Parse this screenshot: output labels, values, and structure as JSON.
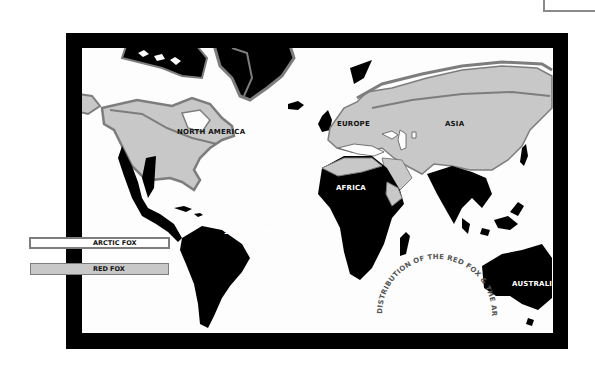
{
  "map": {
    "title": "DISTRIBUTION OF THE RED FOX & THE ARCTIC FOX",
    "regions": [
      {
        "label": "NORTH AMERICA"
      },
      {
        "label": "EUROPE"
      },
      {
        "label": "ASIA"
      },
      {
        "label": "AFRICA"
      },
      {
        "label": "SOUTH AMERICA"
      },
      {
        "label": "AUSTRALIA"
      }
    ]
  },
  "legend": {
    "items": [
      {
        "label": "ARCTIC FOX",
        "style": "outline",
        "color": "#7d7d7d"
      },
      {
        "label": "RED FOX",
        "style": "fill",
        "color": "#c8c8c8"
      }
    ]
  },
  "colors": {
    "frame": "#000000",
    "land": "#000000",
    "red_fox_range": "#c8c8c8",
    "arctic_fox_outline": "#7d7d7d",
    "ocean": "#fdfdfd"
  }
}
